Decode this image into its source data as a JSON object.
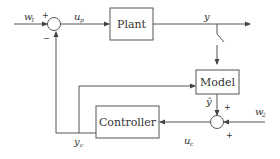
{
  "diagram": {
    "blocks": {
      "plant": "Plant",
      "model": "Model",
      "controller": "Controller"
    },
    "signals": {
      "w1": {
        "base": "w",
        "sub": "1"
      },
      "up": {
        "base": "u",
        "sub": "p"
      },
      "y": {
        "base": "y"
      },
      "yhat": {
        "base": "ŷ"
      },
      "w2": {
        "base": "w",
        "sub": "2"
      },
      "uc": {
        "base": "u",
        "sub": "c"
      },
      "yc": {
        "base": "y",
        "sub": "c"
      }
    },
    "signs": {
      "sum1_top": "+",
      "sum1_bottom": "−",
      "sum2_top": "+",
      "sum2_bottom": "+"
    },
    "colors": {
      "line": "#555555",
      "text": "#333333"
    }
  }
}
